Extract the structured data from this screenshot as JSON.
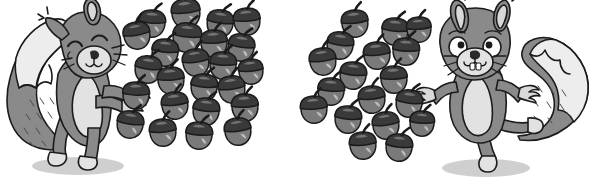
{
  "illustration": {
    "title": "Two cartoon squirrels with groups of acorns",
    "background_color": "#ffffff",
    "style": "grayscale line-art cartoon"
  },
  "palette": {
    "outline": "#1b1b1b",
    "fur_dark": "#6e6e6e",
    "fur_mid": "#8a8a8a",
    "fur_light": "#d9d9d9",
    "belly": "#e2e2e2",
    "tail_tip": "#ededed",
    "acorn_cap": "#3a3a3a",
    "acorn_nut": "#7a7a7a",
    "acorn_highlight": "#c9c9c9",
    "shadow": "#cfcfcf"
  },
  "groups": [
    {
      "id": "left-group",
      "squirrel": {
        "name": "left-squirrel",
        "pose": "standing, eyes closed, one paw raised",
        "facing": "right",
        "position": {
          "x": 4,
          "y": 8,
          "width": 128,
          "height": 172
        }
      },
      "acorn_cluster": {
        "name": "left-acorn-cluster",
        "count": 24,
        "bounds": {
          "x": 118,
          "y": 6,
          "width": 146,
          "height": 160
        },
        "acorns": [
          {
            "x": 186,
            "y": 14,
            "r": 14,
            "rot": -6
          },
          {
            "x": 152,
            "y": 24,
            "r": 13,
            "rot": 4
          },
          {
            "x": 220,
            "y": 24,
            "r": 13,
            "rot": 8
          },
          {
            "x": 247,
            "y": 22,
            "r": 13,
            "rot": -4
          },
          {
            "x": 137,
            "y": 36,
            "r": 13,
            "rot": -10
          },
          {
            "x": 187,
            "y": 38,
            "r": 14,
            "rot": 5
          },
          {
            "x": 214,
            "y": 44,
            "r": 13,
            "rot": -3
          },
          {
            "x": 165,
            "y": 53,
            "r": 13,
            "rot": 6
          },
          {
            "x": 241,
            "y": 48,
            "r": 13,
            "rot": 9
          },
          {
            "x": 196,
            "y": 63,
            "r": 13,
            "rot": -7
          },
          {
            "x": 223,
            "y": 66,
            "r": 13,
            "rot": 3
          },
          {
            "x": 251,
            "y": 72,
            "r": 12,
            "rot": -5
          },
          {
            "x": 148,
            "y": 70,
            "r": 13,
            "rot": 7
          },
          {
            "x": 171,
            "y": 81,
            "r": 13,
            "rot": -4
          },
          {
            "x": 204,
            "y": 88,
            "r": 13,
            "rot": 5
          },
          {
            "x": 232,
            "y": 90,
            "r": 13,
            "rot": -8
          },
          {
            "x": 136,
            "y": 96,
            "r": 13,
            "rot": 2
          },
          {
            "x": 175,
            "y": 106,
            "r": 13,
            "rot": -6
          },
          {
            "x": 206,
            "y": 112,
            "r": 13,
            "rot": 6
          },
          {
            "x": 245,
            "y": 108,
            "r": 13,
            "rot": -3
          },
          {
            "x": 130,
            "y": 125,
            "r": 13,
            "rot": 8
          },
          {
            "x": 163,
            "y": 133,
            "r": 13,
            "rot": -5
          },
          {
            "x": 199,
            "y": 136,
            "r": 13,
            "rot": 4
          },
          {
            "x": 238,
            "y": 132,
            "r": 13,
            "rot": -7
          }
        ]
      }
    },
    {
      "id": "right-group",
      "squirrel": {
        "name": "right-squirrel",
        "pose": "dancing, eyes open, both paws up, one leg lifted",
        "facing": "left",
        "position": {
          "x": 420,
          "y": 4,
          "width": 172,
          "height": 178
        }
      },
      "acorn_cluster": {
        "name": "right-acorn-cluster",
        "count": 18,
        "bounds": {
          "x": 308,
          "y": 14,
          "width": 122,
          "height": 152
        },
        "acorns": [
          {
            "x": 355,
            "y": 24,
            "r": 13,
            "rot": -6
          },
          {
            "x": 395,
            "y": 32,
            "r": 13,
            "rot": 5
          },
          {
            "x": 419,
            "y": 30,
            "r": 12,
            "rot": -4
          },
          {
            "x": 340,
            "y": 46,
            "r": 13,
            "rot": 7
          },
          {
            "x": 377,
            "y": 56,
            "r": 13,
            "rot": -5
          },
          {
            "x": 406,
            "y": 52,
            "r": 13,
            "rot": 3
          },
          {
            "x": 323,
            "y": 62,
            "r": 13,
            "rot": -8
          },
          {
            "x": 353,
            "y": 76,
            "r": 13,
            "rot": 6
          },
          {
            "x": 394,
            "y": 80,
            "r": 13,
            "rot": -3
          },
          {
            "x": 331,
            "y": 92,
            "r": 13,
            "rot": 4
          },
          {
            "x": 372,
            "y": 100,
            "r": 13,
            "rot": -6
          },
          {
            "x": 409,
            "y": 104,
            "r": 13,
            "rot": 7
          },
          {
            "x": 314,
            "y": 110,
            "r": 13,
            "rot": -4
          },
          {
            "x": 348,
            "y": 120,
            "r": 13,
            "rot": 5
          },
          {
            "x": 386,
            "y": 126,
            "r": 13,
            "rot": -7
          },
          {
            "x": 422,
            "y": 124,
            "r": 12,
            "rot": 3
          },
          {
            "x": 363,
            "y": 146,
            "r": 13,
            "rot": -5
          },
          {
            "x": 399,
            "y": 148,
            "r": 13,
            "rot": 6
          }
        ]
      }
    }
  ]
}
